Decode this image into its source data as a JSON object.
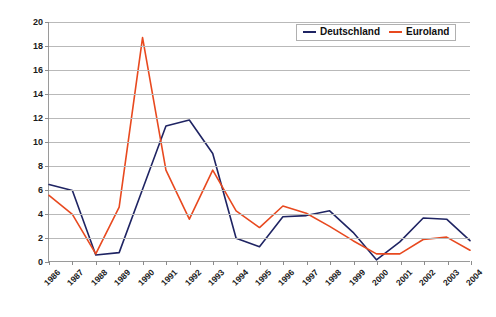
{
  "chart_data": {
    "type": "line",
    "title": "",
    "xlabel": "",
    "ylabel": "Werte der Verlustfunktion",
    "ylim": [
      0,
      20
    ],
    "ytick_step": 2,
    "grid": true,
    "legend_position": "top-right",
    "categories": [
      "1986",
      "1987",
      "1988",
      "1989",
      "1990",
      "1991",
      "1992",
      "1993",
      "1994",
      "1995",
      "1996",
      "1997",
      "1998",
      "1999",
      "2000",
      "2001",
      "2002",
      "2003",
      "2004"
    ],
    "yticks": [
      "0",
      "2",
      "4",
      "6",
      "8",
      "10",
      "12",
      "14",
      "16",
      "18",
      "20"
    ],
    "series": [
      {
        "name": "Deutschland",
        "color": "#1f2463",
        "values": [
          6.4,
          5.9,
          0.5,
          0.7,
          6.0,
          11.3,
          11.8,
          9.0,
          1.9,
          1.2,
          3.7,
          3.8,
          4.2,
          2.4,
          0.1,
          1.6,
          3.6,
          3.5,
          1.7
        ]
      },
      {
        "name": "Euroland",
        "color": "#e8491f",
        "values": [
          5.5,
          3.9,
          0.6,
          4.5,
          18.7,
          7.6,
          3.5,
          7.6,
          4.2,
          2.8,
          4.6,
          4.0,
          2.9,
          1.7,
          0.6,
          0.6,
          1.8,
          2.0,
          0.9
        ]
      }
    ]
  },
  "legend": {
    "entries": [
      {
        "label": "Deutschland",
        "color": "#1f2463"
      },
      {
        "label": "Euroland",
        "color": "#e8491f"
      }
    ]
  }
}
